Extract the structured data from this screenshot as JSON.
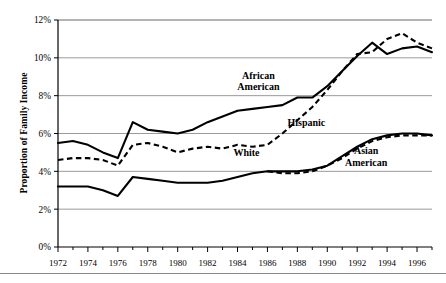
{
  "chart_data": {
    "type": "line",
    "title": "",
    "subtitle": "",
    "xlabel": "",
    "ylabel": "Proportion of Family Income",
    "xlim": [
      1972,
      1997
    ],
    "ylim": [
      0,
      12
    ],
    "yticks": [
      0,
      2,
      4,
      6,
      8,
      10,
      12
    ],
    "ytick_labels": [
      "0%",
      "2%",
      "4%",
      "6%",
      "8%",
      "10%",
      "12%"
    ],
    "x": [
      1972,
      1973,
      1974,
      1975,
      1976,
      1977,
      1978,
      1979,
      1980,
      1981,
      1982,
      1983,
      1984,
      1985,
      1986,
      1987,
      1988,
      1989,
      1990,
      1991,
      1992,
      1993,
      1994,
      1995,
      1996,
      1997
    ],
    "xticks": [
      1972,
      1974,
      1976,
      1978,
      1980,
      1982,
      1984,
      1986,
      1988,
      1990,
      1992,
      1994,
      1996
    ],
    "xtick_labels": [
      "1972",
      "1974",
      "1976",
      "1978",
      "1980",
      "1982",
      "1984",
      "1986",
      "1988",
      "1990",
      "1992",
      "1994",
      "1996"
    ],
    "grid": true,
    "grid_axis": "y",
    "legend": "inline-annotations",
    "series": [
      {
        "name": "African American",
        "style": "solid",
        "label_text": "African\nAmerican",
        "values": [
          5.5,
          5.6,
          5.4,
          5.0,
          4.7,
          6.6,
          6.2,
          6.1,
          6.0,
          6.2,
          6.6,
          6.9,
          7.2,
          7.3,
          7.4,
          7.5,
          7.9,
          7.9,
          8.5,
          9.3,
          10.1,
          10.8,
          10.2,
          10.5,
          10.6,
          10.3
        ]
      },
      {
        "name": "Hispanic",
        "style": "dashed",
        "label_text": "Hispanic",
        "values": [
          4.6,
          4.7,
          4.7,
          4.6,
          4.3,
          5.4,
          5.5,
          5.3,
          5.0,
          5.2,
          5.3,
          5.2,
          5.4,
          5.3,
          5.4,
          6.0,
          6.7,
          7.4,
          8.3,
          9.3,
          10.2,
          10.3,
          11.0,
          11.3,
          10.8,
          10.5
        ]
      },
      {
        "name": "White",
        "style": "solid",
        "label_text": "White",
        "values": [
          3.2,
          3.2,
          3.2,
          3.0,
          2.7,
          3.7,
          3.6,
          3.5,
          3.4,
          3.4,
          3.4,
          3.5,
          3.7,
          3.9,
          4.0,
          4.0,
          4.0,
          4.1,
          4.3,
          4.8,
          5.3,
          5.7,
          5.9,
          6.0,
          6.0,
          5.9
        ]
      },
      {
        "name": "Asian American",
        "style": "dashed",
        "label_text": "Asian\nAmerican",
        "values": [
          null,
          null,
          null,
          null,
          null,
          null,
          null,
          null,
          null,
          null,
          null,
          null,
          null,
          null,
          4.0,
          3.9,
          3.9,
          4.0,
          4.3,
          4.7,
          5.2,
          5.6,
          5.8,
          5.9,
          5.9,
          5.9
        ]
      }
    ],
    "annotations": [
      {
        "text_line1": "African",
        "text_line2": "American",
        "x": 1985.4,
        "y": 8.9
      },
      {
        "text_line1": "Hispanic",
        "text_line2": "",
        "x": 1988.6,
        "y": 6.4
      },
      {
        "text_line1": "White",
        "text_line2": "",
        "x": 1984.6,
        "y": 4.8
      },
      {
        "text_line1": "Asian",
        "text_line2": "American",
        "x": 1992.6,
        "y": 4.9
      }
    ],
    "colors": {
      "line": "#000000",
      "grid": "#9a9a9a",
      "axis": "#000000",
      "background": "#ffffff"
    }
  }
}
